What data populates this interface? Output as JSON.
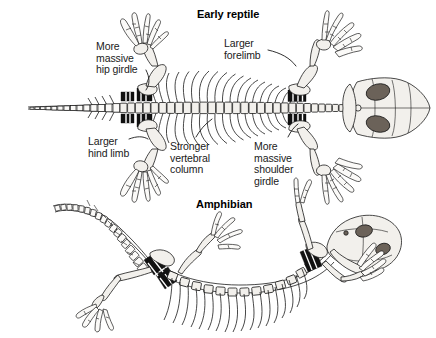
{
  "figure": {
    "kind": "comparative-skeleton-diagram",
    "background_color": "#ffffff",
    "ink_color": "#1a1a1a",
    "width": 436,
    "height": 338
  },
  "titles": {
    "reptile": "Early reptile",
    "amphibian": "Amphibian"
  },
  "annotations": [
    {
      "id": "more-massive-hip-girdle",
      "text": "More\nmassive\nhip girdle",
      "lines": [
        "More",
        "massive",
        "hip girdle"
      ]
    },
    {
      "id": "larger-hind-limb",
      "text": "Larger\nhind limb",
      "lines": [
        "Larger",
        "hind limb"
      ]
    },
    {
      "id": "larger-forelimb",
      "text": "Larger\nforelimb",
      "lines": [
        "Larger",
        "forelimb"
      ]
    },
    {
      "id": "stronger-vertebral-column",
      "text": "Stronger\nvertebral\ncolumn",
      "lines": [
        "Stronger",
        "vertebral",
        "column"
      ]
    },
    {
      "id": "more-massive-shoulder-girdle",
      "text": "More\nmassive\nshoulder\ngirdle",
      "lines": [
        "More",
        "massive",
        "shoulder",
        "girdle"
      ]
    }
  ],
  "specimens": {
    "reptile": {
      "name": "Early reptile",
      "view": "dorsal (top-down)",
      "features": [
        "broad triangular skull",
        "paired eye sockets",
        "long tapering tail",
        "radiating ribs",
        "blackened sacral and pectoral elements",
        "four splayed limbs with five digits"
      ]
    },
    "amphibian": {
      "name": "Amphibian",
      "view": "three-quarter / lateral",
      "features": [
        "oval skull with dark orbits",
        "long curving tail",
        "downward-curving ribs",
        "blackened pelvic and pectoral elements",
        "four slender limbs"
      ]
    }
  }
}
